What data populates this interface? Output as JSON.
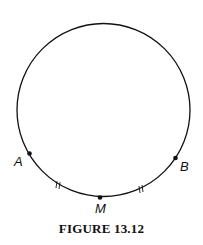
{
  "figure": {
    "caption": "FIGURE 13.12",
    "circle": {
      "cx": 103.5,
      "cy": 110,
      "r": 86.5,
      "stroke": "#111111"
    },
    "points": [
      {
        "label": "A",
        "x": 29.5,
        "y": 153.5
      },
      {
        "label": "M",
        "x": 100,
        "y": 197.5
      },
      {
        "label": "B",
        "x": 175.5,
        "y": 158
      }
    ],
    "congruence_marks": [
      {
        "arc": "AM",
        "mark": "double-tick"
      },
      {
        "arc": "MB",
        "mark": "double-tick"
      }
    ]
  }
}
